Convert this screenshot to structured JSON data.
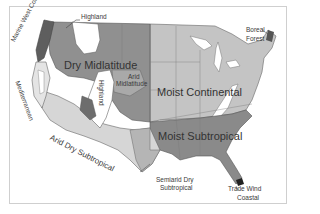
{
  "map": {
    "title": "Climate regions of the contiguous United States",
    "colors": {
      "dry_midlatitude": "#8f8f8f",
      "moist_continental": "#c4c4c4",
      "moist_subtropical": "#8a8a8a",
      "arid_dry_subtropical": "#d6d6d6",
      "highland": "#ffffff",
      "marine_west_coast": "#5e5e5e",
      "boreal_forest": "#555555",
      "trade_wind_coastal": "#2a2a2a",
      "border": "#555555",
      "state_lines": "#7a7a7a"
    },
    "labels": {
      "highland_north": "Highland",
      "marine_west_coast": "Marine West Coast",
      "dry_midlatitude": "Dry Midlatitude",
      "arid_midlatitude_line1": "Arid",
      "arid_midlatitude_line2": "Midlatitude",
      "highland_central": "Highland",
      "mediterranean": "Mediterranean",
      "moist_continental": "Moist  Continental",
      "boreal_forest_line1": "Boreal",
      "boreal_forest_line2": "Forest",
      "moist_subtropical": "Moist  Subtropical",
      "arid_dry_subtropical": "Arid Dry Subtropical",
      "semiarid_line1": "Semiarid Dry",
      "semiarid_line2": "Subtropical",
      "trade_wind_line1": "Trade Wind",
      "trade_wind_line2": "Coastal"
    }
  }
}
